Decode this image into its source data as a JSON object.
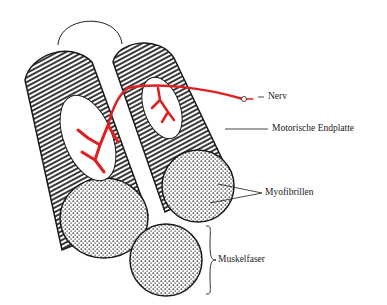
{
  "diagram": {
    "type": "anatomical illustration",
    "colors": {
      "nerve": "#e02020",
      "outline": "#1a1a1a",
      "background": "#ffffff"
    },
    "labels": {
      "nerve": "Nerv",
      "motor_end_plate": "Motorische Endplatte",
      "myofibrils": "Myofibrillen",
      "muscle_fiber": "Muskelfaser"
    }
  }
}
